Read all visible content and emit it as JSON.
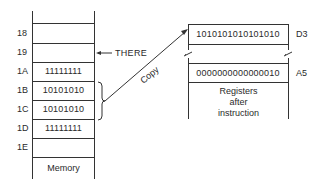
{
  "memory": {
    "label": "Memory",
    "rows": [
      {
        "address": "18",
        "value": ""
      },
      {
        "address": "19",
        "value": ""
      },
      {
        "address": "1A",
        "value": "11111111"
      },
      {
        "address": "1B",
        "value": "10101010"
      },
      {
        "address": "1C",
        "value": "10101010"
      },
      {
        "address": "1D",
        "value": "11111111"
      },
      {
        "address": "1E",
        "value": ""
      }
    ],
    "pointer_label": "THERE"
  },
  "copy_arrow": {
    "label": "Copy"
  },
  "registers": {
    "caption_line1": "Registers",
    "caption_line2": "after",
    "caption_line3": "instruction",
    "rows": [
      {
        "name": "D3",
        "value": "1010101010101010"
      },
      {
        "name": "A5",
        "value": "0000000000000010"
      }
    ]
  }
}
